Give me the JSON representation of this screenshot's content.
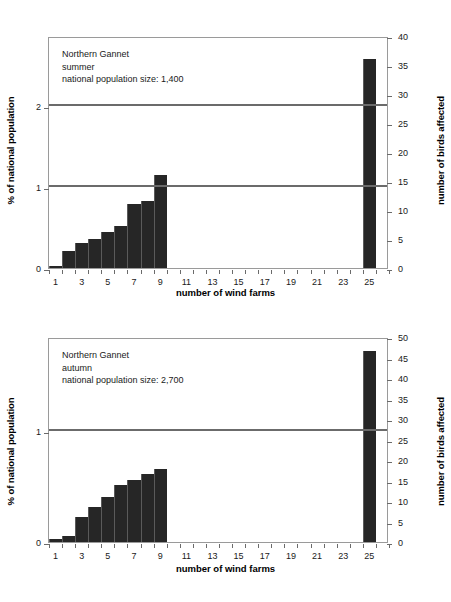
{
  "chart_data": [
    {
      "id": "summer",
      "type": "bar",
      "title": "",
      "annotation_lines": [
        "Northern Gannet",
        "summer",
        "national population size: 1,400"
      ],
      "species": "Northern Gannet",
      "season": "summer",
      "national_population_size": "1,400",
      "xlabel": "number of wind farms",
      "ylabel": "% of national population",
      "ylabel_right": "number of birds affected",
      "categories": [
        1,
        2,
        3,
        4,
        5,
        6,
        7,
        8,
        9,
        25
      ],
      "xtick_labels": [
        "1",
        "3",
        "5",
        "7",
        "9",
        "11",
        "13",
        "15",
        "17",
        "19",
        "21",
        "23",
        "25"
      ],
      "ytick_labels_left": [
        "0",
        "1",
        "2"
      ],
      "ytick_values_left": [
        0,
        1,
        2
      ],
      "ytick_labels_right": [
        "0",
        "5",
        "10",
        "15",
        "20",
        "25",
        "30",
        "35",
        "40"
      ],
      "ytick_values_right": [
        0,
        5,
        10,
        15,
        20,
        25,
        30,
        35,
        40
      ],
      "ylim_left": [
        0,
        2.86
      ],
      "ylim_right": [
        0,
        40
      ],
      "values_percent": [
        0.02,
        0.21,
        0.31,
        0.36,
        0.44,
        0.51,
        0.78,
        0.82,
        1.14,
        2.57
      ],
      "values_birds": [
        0.3,
        3.0,
        4.3,
        5.0,
        6.2,
        7.2,
        11.0,
        11.5,
        16.0,
        36.0
      ],
      "reference_lines": [
        1,
        2
      ],
      "grid": false,
      "legend": "none"
    },
    {
      "id": "autumn",
      "type": "bar",
      "title": "",
      "annotation_lines": [
        "Northern Gannet",
        "autumn",
        "national population size: 2,700"
      ],
      "species": "Northern Gannet",
      "season": "autumn",
      "national_population_size": "2,700",
      "xlabel": "number of wind farms",
      "ylabel": "% of national population",
      "ylabel_right": "number of birds affected",
      "categories": [
        1,
        2,
        3,
        4,
        5,
        6,
        7,
        8,
        9,
        25
      ],
      "xtick_labels": [
        "1",
        "3",
        "5",
        "7",
        "9",
        "11",
        "13",
        "15",
        "17",
        "19",
        "21",
        "23",
        "25"
      ],
      "ytick_labels_left": [
        "0",
        "1"
      ],
      "ytick_values_left": [
        0,
        1
      ],
      "ytick_labels_right": [
        "0",
        "5",
        "10",
        "15",
        "20",
        "25",
        "30",
        "35",
        "40",
        "45",
        "50"
      ],
      "ytick_values_right": [
        0,
        5,
        10,
        15,
        20,
        25,
        30,
        35,
        40,
        45,
        50
      ],
      "ylim_left": [
        0,
        1.85
      ],
      "ylim_right": [
        0,
        50
      ],
      "values_percent": [
        0.03,
        0.05,
        0.22,
        0.32,
        0.41,
        0.52,
        0.56,
        0.62,
        0.66,
        1.72
      ],
      "values_birds": [
        0.8,
        1.4,
        6.0,
        8.6,
        11.0,
        14.0,
        15.1,
        16.7,
        17.8,
        46.5
      ],
      "reference_lines": [
        1
      ],
      "grid": false,
      "legend": "none"
    }
  ]
}
